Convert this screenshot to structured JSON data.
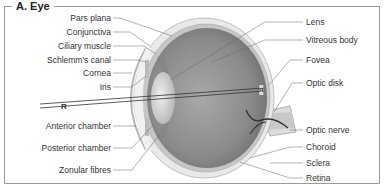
{
  "figure": {
    "title": "A. Eye"
  },
  "labels": {
    "left": [
      {
        "text": "Pars plana"
      },
      {
        "text": "Conjunctiva"
      },
      {
        "text": "Ciliary muscle"
      },
      {
        "text": "Schlemm's canal"
      },
      {
        "text": "Cornea"
      },
      {
        "text": "Iris"
      },
      {
        "text": "Anterior chamber"
      },
      {
        "text": "Posterior chamber"
      },
      {
        "text": "Zonular fibres"
      }
    ],
    "right": [
      {
        "text": "Lens"
      },
      {
        "text": "Vitreous body"
      },
      {
        "text": "Fovea"
      },
      {
        "text": "Optic disk"
      },
      {
        "text": "Optic nerve"
      },
      {
        "text": "Choroid"
      },
      {
        "text": "Sclera"
      },
      {
        "text": "Retina"
      }
    ]
  },
  "markers": {
    "object": "R",
    "image": "R"
  },
  "colors": {
    "frame": "#9a9a9a",
    "sclera": "#e6e6e6",
    "choroid": "#bdbdbd",
    "vitreous": "#8a8a8a",
    "lens": "#d4d4d4",
    "leader": "#555555"
  }
}
